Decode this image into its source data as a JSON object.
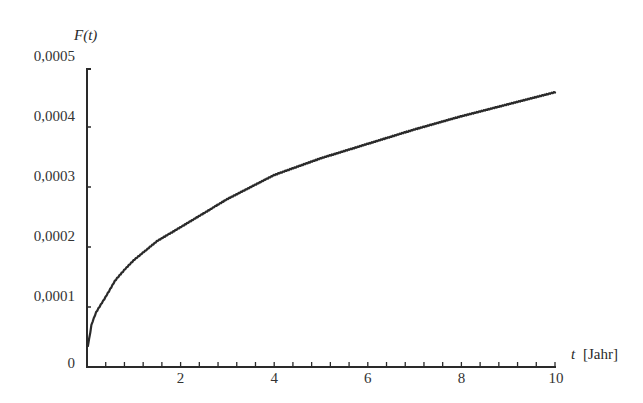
{
  "chart_data": {
    "type": "line",
    "title": "",
    "xlabel": "t [Jahr]",
    "xlabel_var": "t",
    "xlabel_unit": "[Jahr]",
    "ylabel": "F(t)",
    "xlim": [
      0,
      10
    ],
    "ylim": [
      0,
      0.0005
    ],
    "grid": false,
    "legend": null,
    "x_ticks": [
      2,
      4,
      6,
      8,
      10
    ],
    "x_tick_labels": [
      "2",
      "4",
      "6",
      "8",
      "10"
    ],
    "x_minor_tick_step": 0.4,
    "y_ticks": [
      0,
      0.0001,
      0.0002,
      0.0003,
      0.0004,
      0.0005
    ],
    "y_tick_labels": [
      "0",
      "0,0001",
      "0,0002",
      "0,0003",
      "0,0004",
      "0,0005"
    ],
    "series": [
      {
        "name": "F(t)",
        "color": "#2a2a2a",
        "x": [
          0.02,
          0.1,
          0.2,
          0.4,
          0.6,
          0.8,
          1,
          1.5,
          2,
          3,
          4,
          5,
          6,
          7,
          8,
          9,
          10
        ],
        "values": [
          3.5e-05,
          7.2e-05,
          9.2e-05,
          0.000117,
          0.000144,
          0.000162,
          0.000178,
          0.00021,
          0.000233,
          0.00028,
          0.00032,
          0.000348,
          0.000372,
          0.000396,
          0.000418,
          0.000438,
          0.000458
        ]
      }
    ]
  },
  "labels": {
    "y_axis_title": "F(t)",
    "x_axis_var": "t",
    "x_axis_unit": "[Jahr]"
  }
}
